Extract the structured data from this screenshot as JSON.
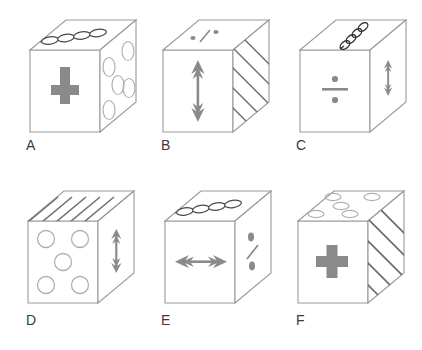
{
  "figure": {
    "background_color": "#ffffff",
    "edge_color": "#9a9a9a",
    "symbol_color": "#7a7a7a",
    "hatch_color": "#6e6e6e",
    "label_color": "#3a3a3a",
    "rows": 2,
    "columns": 3
  },
  "cubes": [
    {
      "label": "A",
      "front": "plus-sign",
      "top": "chain-of-four-ellipses",
      "right": "five-circles"
    },
    {
      "label": "B",
      "front": "vertical-double-arrow",
      "top": "percent-symbol",
      "right": "diagonal-hatching"
    },
    {
      "label": "C",
      "front": "division-sign",
      "top": "spiral-coil",
      "right": "vertical-double-arrow"
    },
    {
      "label": "D",
      "front": "five-circles",
      "top": "diagonal-hatching",
      "right": "vertical-double-arrow"
    },
    {
      "label": "E",
      "front": "horizontal-double-arrow",
      "top": "chain-of-four-ellipses",
      "right": "percent-symbol"
    },
    {
      "label": "F",
      "front": "plus-sign",
      "top": "five-circles",
      "right": "diagonal-hatching"
    }
  ]
}
